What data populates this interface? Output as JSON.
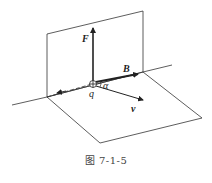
{
  "figure": {
    "labels": {
      "force": "F",
      "field": "B",
      "velocity": "v",
      "charge": "q",
      "angle": "α"
    },
    "caption": "图   7-1-5",
    "colors": {
      "line": "#222222",
      "text": "#222222",
      "background": "#ffffff"
    }
  }
}
